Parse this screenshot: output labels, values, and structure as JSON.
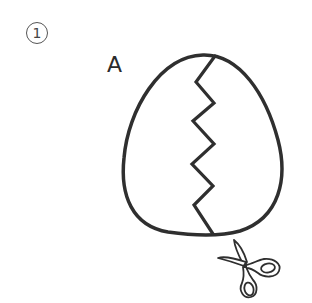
{
  "figure": {
    "step_number": "1",
    "step_glyph": "circled-number",
    "piece_label": "A",
    "shape": "egg",
    "cut_line": "zigzag",
    "tool_icon": "scissors-icon",
    "stroke_color": "#2f2f2f",
    "background_color": "#ffffff"
  }
}
